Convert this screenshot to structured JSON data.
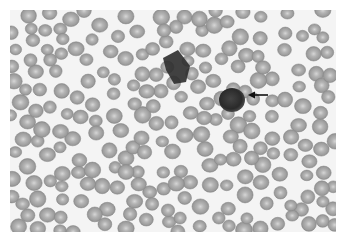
{
  "image": {
    "kind": "blood smear micrograph",
    "colors": {
      "background": "#ffffff",
      "field": "#f4f4f4",
      "rbc_rim": "#8e8e8e",
      "rbc_body": "#a8a8a8",
      "rbc_center": "#cfcfcf",
      "wbc_dark": "#2a2a2a",
      "wbc_mid": "#555555",
      "arrow": "#111111"
    },
    "frame": {
      "x": 10,
      "y": 10,
      "width": 326,
      "height": 222
    },
    "dark_cells": [
      {
        "label": "smudge-cell-upper",
        "points": "163,58 178,50 190,66 186,82 174,84 166,70"
      },
      {
        "label": "leukocyte-lower",
        "cx": 232,
        "cy": 100,
        "rx": 13,
        "ry": 12
      }
    ],
    "arrow": {
      "x1": 268,
      "y1": 95,
      "x2": 248,
      "y2": 95,
      "points_to": "leukocyte-lower"
    }
  }
}
